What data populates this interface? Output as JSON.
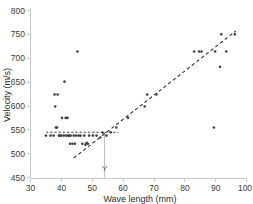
{
  "chart_data": {
    "type": "scatter",
    "title": "",
    "xlabel": "Wave length (mm)",
    "ylabel": "Velocity (m/s)",
    "xlim": [
      30,
      100
    ],
    "ylim": [
      450,
      800
    ],
    "xticks": [
      30,
      40,
      50,
      60,
      70,
      80,
      90,
      100
    ],
    "yticks": [
      450,
      500,
      550,
      600,
      650,
      700,
      750,
      800
    ],
    "grid": false,
    "legend": null,
    "points": [
      {
        "x": 35.0,
        "y": 538
      },
      {
        "x": 36.5,
        "y": 538
      },
      {
        "x": 37.5,
        "y": 538
      },
      {
        "x": 37.8,
        "y": 624
      },
      {
        "x": 38.0,
        "y": 599
      },
      {
        "x": 38.2,
        "y": 555
      },
      {
        "x": 38.6,
        "y": 555
      },
      {
        "x": 38.8,
        "y": 624
      },
      {
        "x": 39.2,
        "y": 538
      },
      {
        "x": 39.6,
        "y": 538
      },
      {
        "x": 40.0,
        "y": 538
      },
      {
        "x": 40.2,
        "y": 575
      },
      {
        "x": 40.8,
        "y": 538
      },
      {
        "x": 41.0,
        "y": 651
      },
      {
        "x": 41.4,
        "y": 575
      },
      {
        "x": 41.6,
        "y": 538
      },
      {
        "x": 42.0,
        "y": 575
      },
      {
        "x": 42.2,
        "y": 538
      },
      {
        "x": 42.6,
        "y": 538
      },
      {
        "x": 42.8,
        "y": 521
      },
      {
        "x": 43.0,
        "y": 538
      },
      {
        "x": 43.6,
        "y": 521
      },
      {
        "x": 44.0,
        "y": 538
      },
      {
        "x": 44.4,
        "y": 521
      },
      {
        "x": 44.8,
        "y": 538
      },
      {
        "x": 45.2,
        "y": 714
      },
      {
        "x": 45.6,
        "y": 538
      },
      {
        "x": 46.2,
        "y": 538
      },
      {
        "x": 46.8,
        "y": 521
      },
      {
        "x": 47.4,
        "y": 538
      },
      {
        "x": 47.8,
        "y": 519
      },
      {
        "x": 48.2,
        "y": 523
      },
      {
        "x": 48.6,
        "y": 521
      },
      {
        "x": 49.0,
        "y": 538
      },
      {
        "x": 50.2,
        "y": 538
      },
      {
        "x": 51.4,
        "y": 538
      },
      {
        "x": 52.6,
        "y": 534
      },
      {
        "x": 53.4,
        "y": 544
      },
      {
        "x": 54.6,
        "y": 538
      },
      {
        "x": 56.0,
        "y": 545
      },
      {
        "x": 57.8,
        "y": 555
      },
      {
        "x": 61.6,
        "y": 575
      },
      {
        "x": 67.0,
        "y": 599
      },
      {
        "x": 67.8,
        "y": 624
      },
      {
        "x": 70.8,
        "y": 624
      },
      {
        "x": 83.0,
        "y": 714
      },
      {
        "x": 84.6,
        "y": 714
      },
      {
        "x": 85.4,
        "y": 714
      },
      {
        "x": 89.4,
        "y": 555
      },
      {
        "x": 89.8,
        "y": 714
      },
      {
        "x": 91.4,
        "y": 682
      },
      {
        "x": 91.8,
        "y": 750
      },
      {
        "x": 93.4,
        "y": 714
      },
      {
        "x": 96.2,
        "y": 750
      }
    ],
    "trend_line": {
      "type": "dashed",
      "x_start": 44.0,
      "y_start": 491,
      "x_end": 96.5,
      "y_end": 757
    },
    "reference_lines": {
      "horizontal": {
        "value": 545,
        "x_start": 35.0,
        "x_end": 58.5,
        "style": "dashed"
      },
      "vertical": {
        "value": 54.0,
        "y_start": 545,
        "y_end": 450,
        "style": "solid",
        "label": "Y"
      }
    },
    "annotations": [
      {
        "text": "Y",
        "x": 54.0,
        "y": 463
      }
    ]
  },
  "colors": {
    "point": "#404040",
    "trend": "#333333",
    "axis": "#c9c9c9",
    "text": "#2b2b2b",
    "background": "#ffffff"
  }
}
